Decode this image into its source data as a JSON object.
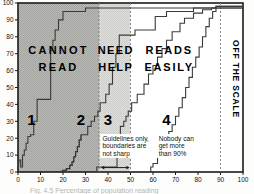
{
  "figure": {
    "frame": {
      "left": 18,
      "right": 243,
      "top": 3,
      "bottom": 172
    },
    "caption_clipped": "Fig. 4.5 Percentage of population reading"
  },
  "axes": {
    "x": {
      "min": 0,
      "max": 100,
      "ticks": [
        0,
        10,
        20,
        30,
        40,
        50,
        60,
        70,
        80,
        90,
        100
      ],
      "tick_labels": [
        "0",
        "10",
        "20",
        "30",
        "40",
        "50",
        "60",
        "70",
        "80",
        "90",
        "100"
      ]
    },
    "y": {
      "min": 0,
      "max": 100,
      "ticks": [
        0,
        10,
        20,
        30,
        40,
        50,
        60,
        70,
        80,
        90,
        100
      ],
      "tick_labels": [
        "0",
        "10",
        "20",
        "30",
        "40",
        "50",
        "60",
        "70",
        "80",
        "90",
        "100"
      ]
    }
  },
  "zones": [
    {
      "name": "cannot-read",
      "label_line1": "CANNOT",
      "label_line2": "READ",
      "x_start": 0,
      "x_end": 36,
      "fill": "#b5b5b2"
    },
    {
      "name": "need-help",
      "label_line1": "NEED",
      "label_line2": "HELP",
      "x_start": 36,
      "x_end": 50,
      "fill": "#d6d6d3"
    },
    {
      "name": "reads-easily",
      "label_line1": "READS",
      "label_line2": "EASILY",
      "x_start": 50,
      "x_end": 100,
      "fill": "#ffffff"
    }
  ],
  "guides": [
    {
      "name": "guide-36",
      "x": 36
    },
    {
      "name": "guide-50",
      "x": 50
    },
    {
      "name": "guide-90",
      "x": 90
    }
  ],
  "annotations": {
    "boundaries_note": [
      "Guidelines only,",
      "boundaries are",
      "not sharp"
    ],
    "ceiling_note": [
      "Nobody can",
      "get more",
      "than 90%"
    ],
    "off_the_scale": "OFF THE SCALE"
  },
  "curve_labels": [
    {
      "name": "curve-label-1",
      "text": "1",
      "x": 6,
      "y": 28
    },
    {
      "name": "curve-label-2",
      "text": "2",
      "x": 28,
      "y": 28
    },
    {
      "name": "curve-label-3",
      "text": "3",
      "x": 40,
      "y": 28
    },
    {
      "name": "curve-label-4",
      "text": "4",
      "x": 66,
      "y": 28
    }
  ],
  "chart_data": {
    "type": "line",
    "title": "",
    "xlabel": "",
    "ylabel": "",
    "xlim": [
      0,
      100
    ],
    "ylim": [
      0,
      100
    ],
    "grid": false,
    "legend": "none",
    "step_style": "post",
    "series": [
      {
        "name": "1",
        "style": "step",
        "points": [
          [
            0,
            0
          ],
          [
            0.4,
            7
          ],
          [
            1.2,
            7
          ],
          [
            1.2,
            3
          ],
          [
            2.0,
            3
          ],
          [
            2.0,
            10
          ],
          [
            2.8,
            10
          ],
          [
            2.8,
            13
          ],
          [
            3.6,
            13
          ],
          [
            3.6,
            17
          ],
          [
            4.4,
            17
          ],
          [
            4.4,
            21
          ],
          [
            5.6,
            21
          ],
          [
            5.6,
            22
          ],
          [
            7.0,
            22
          ],
          [
            7.0,
            30
          ],
          [
            8.5,
            30
          ],
          [
            8.5,
            43
          ],
          [
            14.5,
            43
          ],
          [
            14.5,
            72
          ],
          [
            15.5,
            72
          ],
          [
            15.5,
            78
          ],
          [
            16.5,
            78
          ],
          [
            16.5,
            84
          ],
          [
            18.0,
            84
          ],
          [
            18.0,
            90
          ],
          [
            20.0,
            90
          ],
          [
            20.0,
            95
          ],
          [
            30.0,
            95
          ],
          [
            30.0,
            97
          ],
          [
            88.0,
            97
          ],
          [
            88.0,
            98
          ],
          [
            100,
            98
          ]
        ]
      },
      {
        "name": "2",
        "style": "step-dotted-lower",
        "points": [
          [
            19.0,
            0
          ],
          [
            20.0,
            1
          ],
          [
            21.5,
            1
          ],
          [
            21.5,
            2
          ],
          [
            23.0,
            2
          ],
          [
            23.0,
            4
          ],
          [
            24.0,
            4
          ],
          [
            24.0,
            6
          ],
          [
            24.8,
            6
          ],
          [
            24.8,
            9
          ],
          [
            25.6,
            9
          ],
          [
            25.6,
            12
          ],
          [
            26.4,
            12
          ],
          [
            26.4,
            15
          ],
          [
            27.2,
            15
          ],
          [
            27.2,
            19
          ],
          [
            28.0,
            19
          ],
          [
            28.0,
            22
          ],
          [
            31.0,
            22
          ],
          [
            31.0,
            27
          ],
          [
            32.5,
            27
          ],
          [
            32.5,
            30
          ],
          [
            34.0,
            30
          ],
          [
            34.0,
            33
          ],
          [
            35.5,
            33
          ],
          [
            35.5,
            36
          ],
          [
            36.5,
            36
          ],
          [
            36.5,
            41
          ],
          [
            39.0,
            41
          ],
          [
            39.0,
            46
          ],
          [
            40.5,
            46
          ],
          [
            40.5,
            52
          ],
          [
            42.0,
            52
          ],
          [
            42.0,
            62
          ],
          [
            43.5,
            62
          ],
          [
            43.5,
            70
          ],
          [
            45.0,
            70
          ],
          [
            45.0,
            81
          ],
          [
            52.0,
            81
          ],
          [
            52.0,
            84
          ],
          [
            61.0,
            84
          ],
          [
            61.0,
            92
          ],
          [
            66.0,
            92
          ],
          [
            66.0,
            95
          ],
          [
            78.0,
            95
          ],
          [
            78.0,
            97
          ],
          [
            88.0,
            97
          ],
          [
            88.0,
            98
          ],
          [
            100,
            98
          ]
        ],
        "dotted_until": 28.0
      },
      {
        "name": "3",
        "style": "step",
        "points": [
          [
            35.0,
            0
          ],
          [
            35.0,
            3
          ],
          [
            44.0,
            3
          ],
          [
            44.0,
            21
          ],
          [
            45.5,
            21
          ],
          [
            45.5,
            27
          ],
          [
            47.0,
            27
          ],
          [
            47.0,
            30
          ],
          [
            48.0,
            30
          ],
          [
            48.0,
            33
          ],
          [
            49.0,
            33
          ],
          [
            49.0,
            36
          ],
          [
            50.5,
            36
          ],
          [
            50.5,
            41
          ],
          [
            53.0,
            41
          ],
          [
            53.0,
            46
          ],
          [
            56.0,
            46
          ],
          [
            56.0,
            52
          ],
          [
            58.0,
            52
          ],
          [
            58.0,
            58
          ],
          [
            60.0,
            58
          ],
          [
            60.0,
            63
          ],
          [
            62.0,
            63
          ],
          [
            62.0,
            68
          ],
          [
            64.0,
            68
          ],
          [
            64.0,
            73
          ],
          [
            66.0,
            73
          ],
          [
            66.0,
            78
          ],
          [
            68.5,
            78
          ],
          [
            68.5,
            83
          ],
          [
            72.0,
            83
          ],
          [
            72.0,
            88
          ],
          [
            74.0,
            88
          ],
          [
            74.0,
            91
          ],
          [
            78.0,
            91
          ],
          [
            78.0,
            94
          ],
          [
            82.0,
            94
          ],
          [
            82.0,
            96
          ],
          [
            86.0,
            96
          ],
          [
            86.0,
            97
          ],
          [
            100,
            97
          ]
        ]
      },
      {
        "name": "4",
        "style": "step",
        "points": [
          [
            59.0,
            0
          ],
          [
            59.0,
            3
          ],
          [
            60.0,
            3
          ],
          [
            60.0,
            5
          ],
          [
            62.0,
            5
          ],
          [
            62.0,
            9
          ],
          [
            63.0,
            9
          ],
          [
            63.0,
            12
          ],
          [
            64.5,
            12
          ],
          [
            64.5,
            16
          ],
          [
            66.0,
            16
          ],
          [
            66.0,
            20
          ],
          [
            67.0,
            20
          ],
          [
            67.0,
            24
          ],
          [
            68.5,
            24
          ],
          [
            68.5,
            28
          ],
          [
            70.0,
            28
          ],
          [
            70.0,
            33
          ],
          [
            71.5,
            33
          ],
          [
            71.5,
            38
          ],
          [
            73.0,
            38
          ],
          [
            73.0,
            44
          ],
          [
            74.5,
            44
          ],
          [
            74.5,
            50
          ],
          [
            76.0,
            50
          ],
          [
            76.0,
            56
          ],
          [
            77.5,
            56
          ],
          [
            77.5,
            62
          ],
          [
            79.0,
            62
          ],
          [
            79.0,
            68
          ],
          [
            80.5,
            68
          ],
          [
            80.5,
            74
          ],
          [
            82.0,
            74
          ],
          [
            82.0,
            80
          ],
          [
            83.5,
            80
          ],
          [
            83.5,
            86
          ],
          [
            85.0,
            86
          ],
          [
            85.0,
            91
          ],
          [
            86.5,
            91
          ],
          [
            86.5,
            95
          ],
          [
            88.0,
            95
          ],
          [
            88.0,
            97
          ],
          [
            100,
            97
          ]
        ]
      }
    ]
  }
}
